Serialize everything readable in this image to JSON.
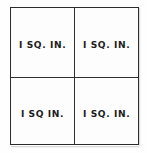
{
  "figure": {
    "name": "square-inch-grid",
    "rows": 2,
    "columns": 2,
    "border_color": "#2b2b2b",
    "divider_color": "#2f2f2f",
    "background_color": "#fdfdfd",
    "text_color": "#1d1d1d"
  },
  "cells": [
    {
      "position": "top-left",
      "label": "I  SQ. IN."
    },
    {
      "position": "top-right",
      "label": "I  SQ. IN."
    },
    {
      "position": "bottom-left",
      "label": "I  SQ  IN."
    },
    {
      "position": "bottom-right",
      "label": "I  SQ. IN."
    }
  ]
}
